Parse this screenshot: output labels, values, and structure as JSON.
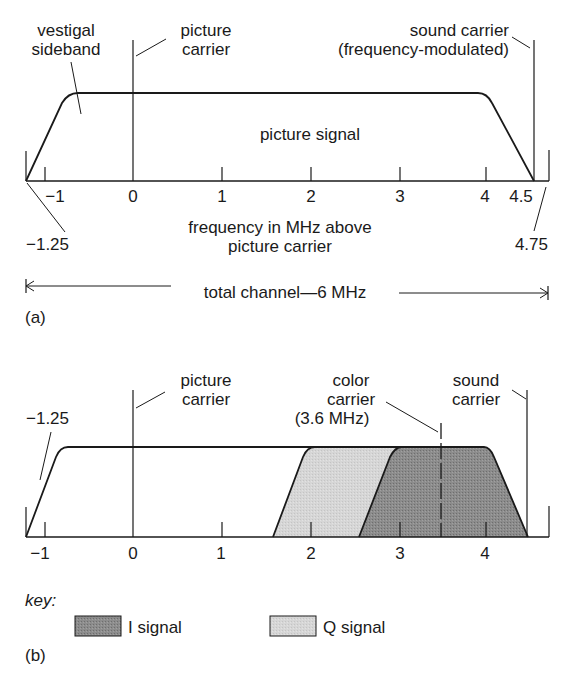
{
  "diagram_a": {
    "panel_label": "(a)",
    "labels": {
      "vestigial_1": "vestigal",
      "vestigial_2": "sideband",
      "picture_carrier_1": "picture",
      "picture_carrier_2": "carrier",
      "sound_carrier_1": "sound carrier",
      "sound_carrier_2": "(frequency-modulated)",
      "picture_signal": "picture signal",
      "xlabel_1": "frequency in MHz above",
      "xlabel_2": "picture carrier",
      "lower_edge": "−1.25",
      "upper_edge": "4.75",
      "total_channel": "total channel—6 MHz"
    },
    "ticks": [
      "−1",
      "0",
      "1",
      "2",
      "3",
      "4",
      "4.5"
    ]
  },
  "diagram_b": {
    "panel_label": "(b)",
    "labels": {
      "lower_edge": "−1.25",
      "picture_carrier_1": "picture",
      "picture_carrier_2": "carrier",
      "color_carrier_1": "color",
      "color_carrier_2": "carrier",
      "color_carrier_3": "(3.6 MHz)",
      "sound_carrier_1": "sound",
      "sound_carrier_2": "carrier"
    },
    "ticks": [
      "−1",
      "0",
      "1",
      "2",
      "3",
      "4"
    ],
    "key": {
      "title": "key:",
      "i_signal": "I signal",
      "q_signal": "Q signal"
    },
    "colors": {
      "i_signal": "#8a8a8a",
      "q_signal": "#d4d4d4"
    }
  }
}
